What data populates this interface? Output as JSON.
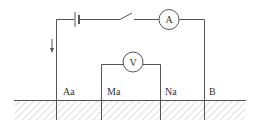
{
  "diagram": {
    "title": "",
    "colors": {
      "wire": "#555555",
      "hatch": "#bbbbbb",
      "text": "#333333"
    },
    "meters": {
      "ammeter": {
        "label": "A"
      },
      "voltmeter": {
        "label": "V"
      }
    },
    "electrodes": [
      {
        "label": "Aa"
      },
      {
        "label": "Ma"
      },
      {
        "label": "Na"
      },
      {
        "label": "B"
      }
    ],
    "components": [
      "battery",
      "switch",
      "ammeter",
      "voltmeter",
      "current-direction-arrow",
      "ground-surface"
    ]
  }
}
